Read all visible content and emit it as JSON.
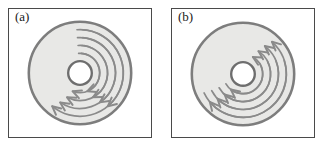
{
  "figure": {
    "type": "scientific-diagram",
    "background_color": "#ffffff",
    "panel_border_color": "#4a4a4a",
    "panels": [
      {
        "id": "a",
        "label": "(a)",
        "flow_pattern": "converging-poloidal",
        "flow_description": "Curved arrows start near the top of the annulus and sweep down both the left and right sides, arrowheads pointing downward and inward toward the lower part of the annulus; the pattern is mirror-symmetric about the vertical axis.",
        "annulus": {
          "center_x": 72,
          "center_y": 65,
          "outer_radius": 52,
          "inner_radius": 12,
          "fill_color": "#e8e8e6",
          "outer_stroke_color": "#7d7d7d",
          "inner_stroke_color": "#6e6e6e",
          "outer_stroke_width": 2.6,
          "inner_stroke_width": 2.4
        },
        "arrow_color": "#8a8a8a",
        "arrow_stroke_width": 1.7,
        "arrow_count": 8,
        "arrows": [
          {
            "side": "left",
            "radius": 20,
            "start_angle": -86,
            "end_angle": 112,
            "head_direction": "down-left"
          },
          {
            "side": "left",
            "radius": 28,
            "start_angle": -86,
            "end_angle": 118,
            "head_direction": "down-left"
          },
          {
            "side": "left",
            "radius": 36,
            "start_angle": -86,
            "end_angle": 124,
            "head_direction": "down-left"
          },
          {
            "side": "left",
            "radius": 44,
            "start_angle": -86,
            "end_angle": 130,
            "head_direction": "down-left"
          },
          {
            "side": "right",
            "radius": 20,
            "start_angle": -94,
            "end_angle": 68,
            "head_direction": "down-right"
          },
          {
            "side": "right",
            "radius": 28,
            "start_angle": -94,
            "end_angle": 62,
            "head_direction": "down-right"
          },
          {
            "side": "right",
            "radius": 36,
            "start_angle": -94,
            "end_angle": 56,
            "head_direction": "down-right"
          },
          {
            "side": "right",
            "radius": 44,
            "start_angle": -94,
            "end_angle": 50,
            "head_direction": "down-right"
          }
        ]
      },
      {
        "id": "b",
        "label": "(b)",
        "flow_pattern": "circulating-counterclockwise",
        "flow_description": "Curved arrows sweep around the annulus in a single rotational sense; arrowheads on the upper right point up and to the right, while arrowheads on the lower left point down and to the left.",
        "annulus": {
          "center_x": 72,
          "center_y": 66,
          "outer_radius": 52,
          "inner_radius": 12,
          "fill_color": "#e8e8e6",
          "outer_stroke_color": "#7d7d7d",
          "inner_stroke_color": "#6e6e6e",
          "outer_stroke_width": 2.6,
          "inner_stroke_width": 2.4
        },
        "arrow_color": "#8a8a8a",
        "arrow_stroke_width": 1.7,
        "arrow_count": 8,
        "arrows": [
          {
            "group": "upper-right",
            "radius": 20,
            "start_angle": 150,
            "end_angle": -60,
            "head_direction": "up-right"
          },
          {
            "group": "upper-right",
            "radius": 28,
            "start_angle": 150,
            "end_angle": -56,
            "head_direction": "up-right"
          },
          {
            "group": "upper-right",
            "radius": 36,
            "start_angle": 152,
            "end_angle": -52,
            "head_direction": "up-right"
          },
          {
            "group": "upper-right",
            "radius": 44,
            "start_angle": 154,
            "end_angle": -48,
            "head_direction": "up-right"
          },
          {
            "group": "lower-left",
            "radius": 20,
            "start_angle": -30,
            "end_angle": 128,
            "head_direction": "down-left"
          },
          {
            "group": "lower-left",
            "radius": 28,
            "start_angle": -26,
            "end_angle": 132,
            "head_direction": "down-left"
          },
          {
            "group": "lower-left",
            "radius": 36,
            "start_angle": -22,
            "end_angle": 136,
            "head_direction": "down-left"
          },
          {
            "group": "lower-left",
            "radius": 44,
            "start_angle": -18,
            "end_angle": 140,
            "head_direction": "down-left"
          }
        ]
      }
    ]
  }
}
